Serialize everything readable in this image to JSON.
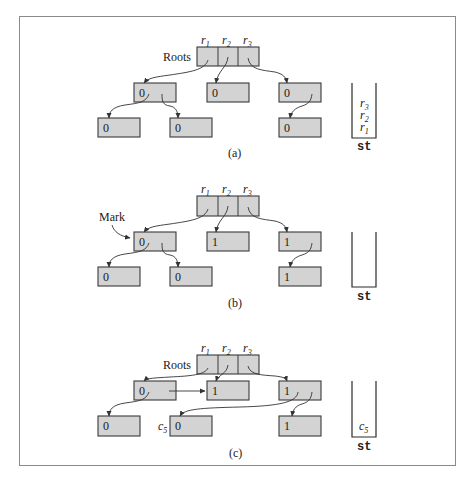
{
  "figure": {
    "fill_color": "#d3d3d3",
    "border_color": "#3a3a3a",
    "frame_color": "#8a8a8a"
  },
  "panels": [
    {
      "caption": "(a)",
      "roots_label": "Roots",
      "root_vars": [
        {
          "base": "r",
          "sub": "1"
        },
        {
          "base": "r",
          "sub": "2"
        },
        {
          "base": "r",
          "sub": "3"
        }
      ],
      "middle_nodes": [
        "0",
        "0",
        "0"
      ],
      "bottom_nodes": [
        "0",
        "0",
        "0"
      ],
      "stack_label": "st",
      "stack_items": [
        {
          "base": "r",
          "sub": "3"
        },
        {
          "base": "r",
          "sub": "2"
        },
        {
          "base": "r",
          "sub": "1"
        }
      ]
    },
    {
      "caption": "(b)",
      "annotation": "Mark",
      "root_vars": [
        {
          "base": "r",
          "sub": "1"
        },
        {
          "base": "r",
          "sub": "2"
        },
        {
          "base": "r",
          "sub": "3"
        }
      ],
      "middle_nodes": [
        "0",
        "1",
        "1"
      ],
      "bottom_nodes": [
        "0",
        "0",
        "1"
      ],
      "stack_label": "st",
      "stack_items": []
    },
    {
      "caption": "(c)",
      "roots_label": "Roots",
      "root_vars": [
        {
          "base": "r",
          "sub": "1"
        },
        {
          "base": "r",
          "sub": "2"
        },
        {
          "base": "r",
          "sub": "3"
        }
      ],
      "middle_nodes": [
        "0",
        "1",
        "1"
      ],
      "bottom_nodes": [
        "0",
        "0",
        "1"
      ],
      "node_label": {
        "base": "c",
        "sub": "5"
      },
      "stack_label": "st",
      "stack_items": [
        {
          "base": "c",
          "sub": "5"
        }
      ]
    }
  ]
}
